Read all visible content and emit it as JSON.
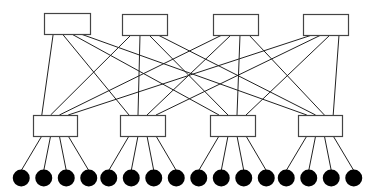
{
  "diagram": {
    "type": "two-tier network topology",
    "colors": {
      "line": "#222222",
      "box_stroke": "#444444",
      "box_fill": "#ffffff",
      "node_fill": "#000000"
    },
    "top_switches": [
      {
        "id": "T1",
        "x": 44,
        "y": 13,
        "w": 46,
        "h": 21
      },
      {
        "id": "T2",
        "x": 122,
        "y": 14,
        "w": 45,
        "h": 21
      },
      {
        "id": "T3",
        "x": 213,
        "y": 14,
        "w": 45,
        "h": 21
      },
      {
        "id": "T4",
        "x": 303,
        "y": 14,
        "w": 45,
        "h": 21
      }
    ],
    "bottom_switches": [
      {
        "id": "B1",
        "x": 33,
        "y": 115,
        "w": 44,
        "h": 21
      },
      {
        "id": "B2",
        "x": 120,
        "y": 115,
        "w": 45,
        "h": 21
      },
      {
        "id": "B3",
        "x": 210,
        "y": 115,
        "w": 45,
        "h": 21
      },
      {
        "id": "B4",
        "x": 298,
        "y": 115,
        "w": 44,
        "h": 21
      }
    ],
    "hosts_per_switch": 4,
    "host_radius": 8.5,
    "host_y": 178
  }
}
